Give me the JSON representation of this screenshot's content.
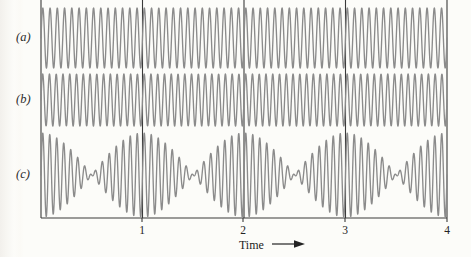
{
  "figure": {
    "background_color": "#fcfcf9",
    "trace_color": "#8b8b8b",
    "axis_color": "#3a3a3a",
    "text_color": "#232323"
  },
  "row_labels": [
    {
      "name": "row-label-a",
      "text": "(a)",
      "y_center": 38
    },
    {
      "name": "row-label-b",
      "text": "(b)",
      "y_center": 100
    },
    {
      "name": "row-label-c",
      "text": "(c)",
      "y_center": 175
    }
  ],
  "axis": {
    "title": "Time",
    "arrow": "⟶",
    "tick_labels": [
      "1",
      "2",
      "3",
      "4"
    ],
    "tick_values": [
      1,
      2,
      3,
      4
    ],
    "x_min": 0,
    "x_max": 4,
    "gridlines_at": [
      1,
      2,
      3
    ]
  },
  "chart_data": {
    "type": "line",
    "title": "",
    "subtitle": "",
    "xlabel": "Time",
    "ylabel": "",
    "xlim": [
      0,
      4
    ],
    "grid": "vertical gridlines at t = 1, 2, 3",
    "legend": "none; traces labelled (a), (b), (c) at left",
    "annotations": [
      "(a) steady sinusoid of one frequency",
      "(b) steady sinusoid of a slightly higher frequency",
      "(c) superposition of (a) and (b) producing beats, one beat per unit time"
    ],
    "series": [
      {
        "name": "(a)",
        "description": "pure sinusoid",
        "frequency_cycles_per_unit": 14,
        "amplitude": 1,
        "phase": 0,
        "baseline_y": 38,
        "pixel_amplitude": 30
      },
      {
        "name": "(b)",
        "description": "pure sinusoid, higher frequency",
        "frequency_cycles_per_unit": 15,
        "amplitude": 1,
        "phase": 0,
        "baseline_y": 100,
        "pixel_amplitude": 26
      },
      {
        "name": "(c)",
        "description": "sum of (a) and (b): beats",
        "component_frequencies": [
          14,
          15
        ],
        "beat_frequency_per_unit": 1,
        "carrier_frequency_cycles_per_unit": 14.5,
        "amplitude": 2,
        "baseline_y": 175,
        "pixel_amplitude": 42
      }
    ]
  },
  "geometry": {
    "frame_left_x": 41,
    "frame_right_x": 447,
    "frame_top_y": 7,
    "baseline_y": 218,
    "tick_x_positions": [
      142,
      243,
      345,
      447
    ]
  }
}
